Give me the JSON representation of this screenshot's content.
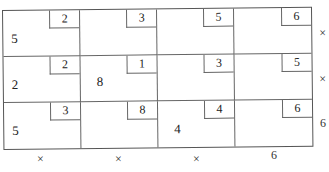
{
  "grid": {
    "rows": 3,
    "cols": 4,
    "cells": [
      [
        {
          "tag": "2",
          "value": "5"
        },
        {
          "tag": "3",
          "value": ""
        },
        {
          "tag": "5",
          "value": ""
        },
        {
          "tag": "6",
          "value": ""
        }
      ],
      [
        {
          "tag": "2",
          "value": "2"
        },
        {
          "tag": "1",
          "value": "8"
        },
        {
          "tag": "3",
          "value": ""
        },
        {
          "tag": "5",
          "value": ""
        }
      ],
      [
        {
          "tag": "3",
          "value": "5"
        },
        {
          "tag": "8",
          "value": ""
        },
        {
          "tag": "4",
          "value": "4"
        },
        {
          "tag": "6",
          "value": ""
        }
      ]
    ]
  },
  "row_hints": [
    "×",
    "×",
    "6"
  ],
  "col_hints": [
    "×",
    "×",
    "×",
    "6"
  ]
}
